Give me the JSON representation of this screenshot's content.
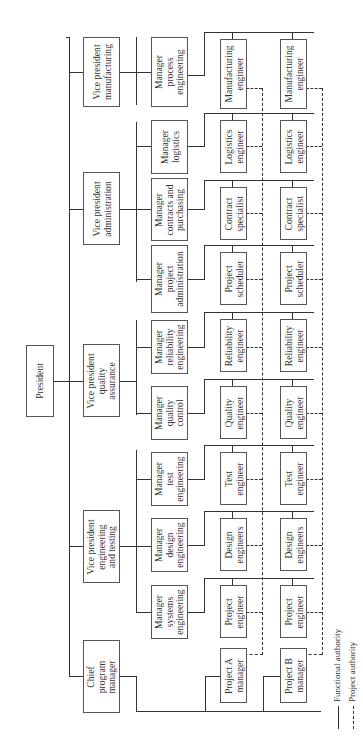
{
  "diagram": {
    "type": "organizational-chart",
    "orientation": "rotated-90-ccw",
    "president": {
      "label": "President"
    },
    "vice_presidents": [
      {
        "id": "vp-manufacturing",
        "label": "Vice president\nmanufacturing"
      },
      {
        "id": "vp-administration",
        "label": "Vice president\nadministration"
      },
      {
        "id": "vp-quality",
        "label": "Vice president\nquality\nassurance"
      },
      {
        "id": "vp-engineering",
        "label": "Vice president\nengineering\nand testing"
      },
      {
        "id": "chief-program",
        "label": "Chief\nprogram\nmanager"
      }
    ],
    "managers": [
      {
        "id": "mgr-process",
        "label": "Manager\nprocess\nengineering"
      },
      {
        "id": "mgr-logistics",
        "label": "Manager\nlogistics"
      },
      {
        "id": "mgr-contracts",
        "label": "Manager\ncontracts and\npurchasing"
      },
      {
        "id": "mgr-project-admin",
        "label": "Manager\nproject\nadministration"
      },
      {
        "id": "mgr-reliability",
        "label": "Manager\nreliability\nengineering"
      },
      {
        "id": "mgr-quality-control",
        "label": "Manager\nquality\ncontrol"
      },
      {
        "id": "mgr-test",
        "label": "Manager\ntest\nengineering"
      },
      {
        "id": "mgr-design",
        "label": "Manager\ndesign\nengineering"
      },
      {
        "id": "mgr-systems",
        "label": "Manager\nsystems\nengineering"
      }
    ],
    "engineers_project_a": [
      {
        "label": "Manufacturing\nengineer"
      },
      {
        "label": "Logistics\nengineer"
      },
      {
        "label": "Contract\nspecialist"
      },
      {
        "label": "Project\nscheduler"
      },
      {
        "label": "Reliability\nengineer"
      },
      {
        "label": "Quality\nengineer"
      },
      {
        "label": "Test\nengineer"
      },
      {
        "label": "Design\nengineers"
      },
      {
        "label": "Project\nengineer"
      }
    ],
    "engineers_project_b": [
      {
        "label": "Manufacturing\nengineer"
      },
      {
        "label": "Logistics\nengineer"
      },
      {
        "label": "Contract\nspecialist"
      },
      {
        "label": "Project\nscheduler"
      },
      {
        "label": "Reliability\nengineer"
      },
      {
        "label": "Quality\nengineer"
      },
      {
        "label": "Test\nengineer"
      },
      {
        "label": "Design\nengineers"
      },
      {
        "label": "Project\nengineer"
      }
    ],
    "project_managers": [
      {
        "label": "Project A\nmanager"
      },
      {
        "label": "Project B\nmanager"
      }
    ],
    "legend": {
      "functional": "Functional authority",
      "project": "Project authority"
    }
  }
}
